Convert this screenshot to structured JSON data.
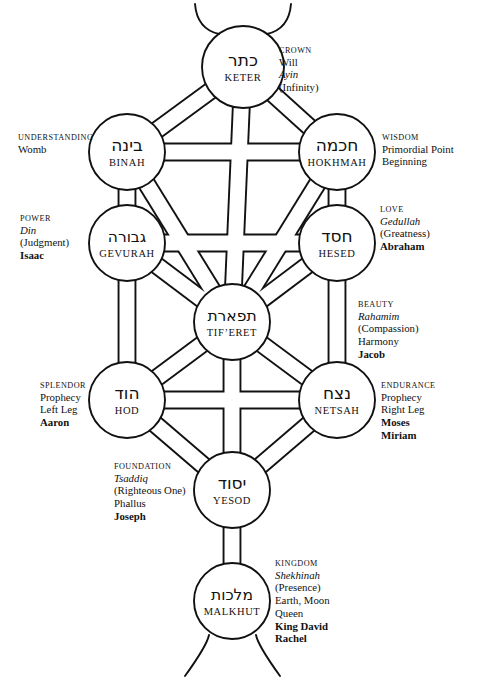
{
  "diagram": {
    "stroke_color": "#111111",
    "background_color": "#ffffff"
  },
  "sefirot": [
    {
      "id": "keter",
      "hebrew": "כתר",
      "translit": "KETER",
      "cx": 243,
      "cy": 67,
      "r": 41,
      "side": "right",
      "label_x": 279,
      "label_y": 46,
      "lines": [
        {
          "text": "CROWN",
          "style": "cap"
        },
        {
          "text": "Will",
          "style": "plain"
        },
        {
          "text": "Ayin",
          "style": "ital"
        },
        {
          "text": "(Infinity)",
          "style": "plain"
        }
      ]
    },
    {
      "id": "binah",
      "hebrew": "בינה",
      "translit": "BINAH",
      "cx": 127,
      "cy": 152,
      "r": 38,
      "side": "left",
      "label_x": 18,
      "label_y": 133,
      "lines": [
        {
          "text": "UNDERSTANDING",
          "style": "cap"
        },
        {
          "text": "Womb",
          "style": "plain"
        }
      ]
    },
    {
      "id": "hokhmah",
      "hebrew": "חכמה",
      "translit": "HOKHMAH",
      "cx": 337,
      "cy": 152,
      "r": 38,
      "side": "right",
      "label_x": 382,
      "label_y": 133,
      "lines": [
        {
          "text": "WISDOM",
          "style": "cap"
        },
        {
          "text": "Primordial Point",
          "style": "plain"
        },
        {
          "text": "Beginning",
          "style": "plain"
        }
      ]
    },
    {
      "id": "gevurah",
      "hebrew": "גבורה",
      "translit": "GEVURAH",
      "cx": 127,
      "cy": 243,
      "r": 38,
      "side": "left",
      "label_x": 20,
      "label_y": 214,
      "lines": [
        {
          "text": "POWER",
          "style": "cap"
        },
        {
          "text": "Din",
          "style": "ital"
        },
        {
          "text": "(Judgment)",
          "style": "plain"
        },
        {
          "text": "Isaac",
          "style": "bold"
        }
      ]
    },
    {
      "id": "hesed",
      "hebrew": "חסד",
      "translit": "HESED",
      "cx": 337,
      "cy": 243,
      "r": 38,
      "side": "right",
      "label_x": 380,
      "label_y": 205,
      "lines": [
        {
          "text": "LOVE",
          "style": "cap"
        },
        {
          "text": "Gedullah",
          "style": "ital"
        },
        {
          "text": "(Greatness)",
          "style": "plain"
        },
        {
          "text": "Abraham",
          "style": "bold"
        }
      ]
    },
    {
      "id": "tiferet",
      "hebrew": "תפארת",
      "translit": "TIF’ERET",
      "cx": 232,
      "cy": 322,
      "r": 38,
      "side": "right",
      "label_x": 358,
      "label_y": 300,
      "lines": [
        {
          "text": "BEAUTY",
          "style": "cap"
        },
        {
          "text": "Rahamim",
          "style": "ital"
        },
        {
          "text": "(Compassion)",
          "style": "plain"
        },
        {
          "text": "Harmony",
          "style": "plain"
        },
        {
          "text": "Jacob",
          "style": "bold"
        }
      ]
    },
    {
      "id": "hod",
      "hebrew": "הוד",
      "translit": "HOD",
      "cx": 127,
      "cy": 400,
      "r": 38,
      "side": "left",
      "label_x": 40,
      "label_y": 381,
      "lines": [
        {
          "text": "SPLENDOR",
          "style": "cap"
        },
        {
          "text": "Prophecy",
          "style": "plain"
        },
        {
          "text": "Left Leg",
          "style": "plain"
        },
        {
          "text": "Aaron",
          "style": "bold"
        }
      ]
    },
    {
      "id": "netsah",
      "hebrew": "נצח",
      "translit": "NETSAH",
      "cx": 337,
      "cy": 400,
      "r": 38,
      "side": "right",
      "label_x": 381,
      "label_y": 381,
      "lines": [
        {
          "text": "ENDURANCE",
          "style": "cap"
        },
        {
          "text": "Prophecy",
          "style": "plain"
        },
        {
          "text": "Right Leg",
          "style": "plain"
        },
        {
          "text": "Moses",
          "style": "bold"
        },
        {
          "text": "Miriam",
          "style": "bold"
        }
      ]
    },
    {
      "id": "yesod",
      "hebrew": "יסוד",
      "translit": "YESOD",
      "cx": 232,
      "cy": 490,
      "r": 38,
      "side": "left",
      "label_x": 114,
      "label_y": 462,
      "lines": [
        {
          "text": "FOUNDATION",
          "style": "cap"
        },
        {
          "text": "Tsaddiq",
          "style": "ital"
        },
        {
          "text": "(Righteous One)",
          "style": "plain"
        },
        {
          "text": "Phallus",
          "style": "plain"
        },
        {
          "text": "Joseph",
          "style": "bold"
        }
      ]
    },
    {
      "id": "malkhut",
      "hebrew": "מלכות",
      "translit": "MALKHUT",
      "cx": 232,
      "cy": 601,
      "r": 38,
      "side": "right",
      "label_x": 275,
      "label_y": 559,
      "lines": [
        {
          "text": "KINGDOM",
          "style": "cap"
        },
        {
          "text": "Shekhinah",
          "style": "ital"
        },
        {
          "text": "(Presence)",
          "style": "plain"
        },
        {
          "text": "Earth, Moon",
          "style": "plain"
        },
        {
          "text": "Queen",
          "style": "plain"
        },
        {
          "text": "King David",
          "style": "bold"
        },
        {
          "text": "Rachel",
          "style": "bold"
        }
      ]
    }
  ],
  "paths": [
    {
      "from": "keter",
      "to": "binah"
    },
    {
      "from": "keter",
      "to": "hokhmah"
    },
    {
      "from": "keter",
      "to": "tiferet"
    },
    {
      "from": "binah",
      "to": "hokhmah"
    },
    {
      "from": "binah",
      "to": "gevurah"
    },
    {
      "from": "binah",
      "to": "tiferet"
    },
    {
      "from": "hokhmah",
      "to": "hesed"
    },
    {
      "from": "hokhmah",
      "to": "tiferet"
    },
    {
      "from": "gevurah",
      "to": "hesed"
    },
    {
      "from": "gevurah",
      "to": "tiferet"
    },
    {
      "from": "gevurah",
      "to": "hod"
    },
    {
      "from": "hesed",
      "to": "tiferet"
    },
    {
      "from": "hesed",
      "to": "netsah"
    },
    {
      "from": "tiferet",
      "to": "hod"
    },
    {
      "from": "tiferet",
      "to": "netsah"
    },
    {
      "from": "tiferet",
      "to": "yesod"
    },
    {
      "from": "hod",
      "to": "netsah"
    },
    {
      "from": "hod",
      "to": "yesod"
    },
    {
      "from": "netsah",
      "to": "yesod"
    },
    {
      "from": "yesod",
      "to": "malkhut"
    }
  ],
  "extensions": {
    "top": [
      {
        "x1": 219,
        "y1": 34,
        "x2": 195,
        "y2": 4
      },
      {
        "x1": 267,
        "y1": 34,
        "x2": 291,
        "y2": 4
      }
    ],
    "bottom": [
      {
        "x1": 209,
        "y1": 635,
        "x2": 185,
        "y2": 676
      },
      {
        "x1": 256,
        "y1": 635,
        "x2": 280,
        "y2": 676
      }
    ]
  }
}
